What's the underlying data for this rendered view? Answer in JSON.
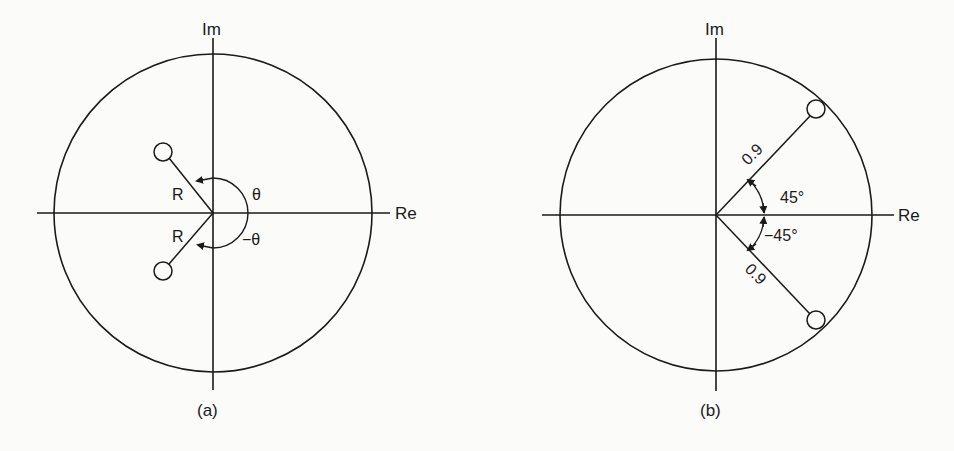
{
  "panels": [
    {
      "id": "a",
      "caption": "(a)",
      "axes": {
        "x_label": "Re",
        "y_label": "Im"
      },
      "unit_circle": true,
      "zeros": [
        {
          "magnitude_label": "R",
          "angle_label": "θ"
        },
        {
          "magnitude_label": "R",
          "angle_label": "−θ"
        }
      ]
    },
    {
      "id": "b",
      "caption": "(b)",
      "axes": {
        "x_label": "Re",
        "y_label": "Im"
      },
      "unit_circle": true,
      "zeros": [
        {
          "magnitude_label": "0.9",
          "angle_label": "45°"
        },
        {
          "magnitude_label": "0.9",
          "angle_label": "−45°"
        }
      ]
    }
  ],
  "colors": {
    "ink": "#1a1a1a",
    "background": "#fbfbf9"
  }
}
